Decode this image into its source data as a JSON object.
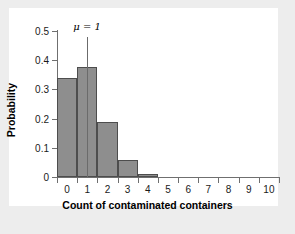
{
  "chart_data": {
    "type": "bar",
    "title": "",
    "xlabel": "Count of contaminated containers",
    "ylabel": "Probability",
    "categories": [
      "0",
      "1",
      "2",
      "3",
      "4",
      "5",
      "6",
      "7",
      "8",
      "9",
      "10"
    ],
    "values": [
      0.34,
      0.378,
      0.188,
      0.058,
      0.012,
      0,
      0,
      0,
      0,
      0,
      0
    ],
    "xlim": [
      -0.5,
      10.5
    ],
    "ylim": [
      0,
      0.5
    ],
    "x_tick_labels": [
      "0",
      "1",
      "2",
      "3",
      "4",
      "5",
      "6",
      "7",
      "8",
      "9",
      "10"
    ],
    "y_tick_labels": [
      "0",
      "0.1",
      "0.2",
      "0.3",
      "0.4",
      "0.5"
    ],
    "y_tick_values": [
      0,
      0.1,
      0.2,
      0.3,
      0.4,
      0.5
    ],
    "grid": false,
    "legend": "none",
    "annotations": [
      {
        "text": "μ = 1",
        "x": 1,
        "y_top": 0.48,
        "type": "vertical-marker-line"
      }
    ],
    "colors": {
      "bar_fill": "#8e8e8e",
      "bar_edge": "#4d4d4d",
      "axis": "#6f6f6f",
      "panel_background": "#ffffff",
      "figure_background": "#ededed",
      "text": "#1a1a1a",
      "marker_line": "#6b6b6b"
    }
  }
}
